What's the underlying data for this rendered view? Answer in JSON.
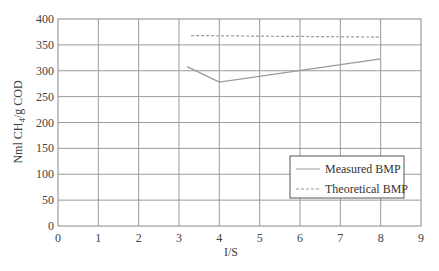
{
  "chart_data": {
    "type": "line",
    "title": "",
    "xlabel": "I/S",
    "ylabel": "Nml CH4/g COD",
    "ylabel_main": "Nml CH",
    "ylabel_sub": "4",
    "ylabel_rest": "/g COD",
    "xlim": [
      0,
      9
    ],
    "ylim": [
      0,
      400
    ],
    "xticks": [
      0,
      1,
      2,
      3,
      4,
      5,
      6,
      7,
      8,
      9
    ],
    "yticks": [
      0,
      50,
      100,
      150,
      200,
      250,
      300,
      350,
      400
    ],
    "grid": true,
    "legend_position": "lower right",
    "series": [
      {
        "name": "Measured BMP",
        "style": "solid",
        "color": "#9a9a9a",
        "x": [
          3.2,
          4.0,
          8.0
        ],
        "y": [
          308,
          278,
          323
        ]
      },
      {
        "name": "Theoretical BMP",
        "style": "dashed",
        "color": "#9a9a9a",
        "x": [
          3.3,
          8.0
        ],
        "y": [
          368,
          365
        ]
      }
    ]
  }
}
